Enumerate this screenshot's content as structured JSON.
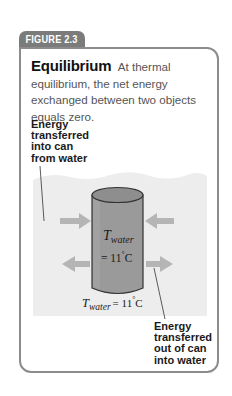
{
  "figure": {
    "tab_label": "FIGURE 2.3",
    "title": "Equilibrium",
    "description": "At thermal equilibrium, the net energy exchanged between two objects equals zero."
  },
  "labels": {
    "energy_in": [
      "Energy",
      "transferred",
      "into can",
      "from water"
    ],
    "energy_out": [
      "Energy",
      "transferred",
      "out of can",
      "into water"
    ]
  },
  "can": {
    "temp_symbol": "T",
    "temp_subscript": "water",
    "temp_value": "= 11",
    "temp_unit_degree": "°",
    "temp_unit": "C"
  },
  "water": {
    "temp_symbol": "T",
    "temp_subscript": "water",
    "temp_value": "= 11",
    "temp_unit_degree": "°",
    "temp_unit": "C"
  },
  "colors": {
    "tab": "#7b7b7b",
    "border": "#8c8c8c",
    "water": "#ededed",
    "can_body": "#9a9a9a",
    "can_top": "#8e8e8e",
    "arrow": "#b5b5b5"
  }
}
